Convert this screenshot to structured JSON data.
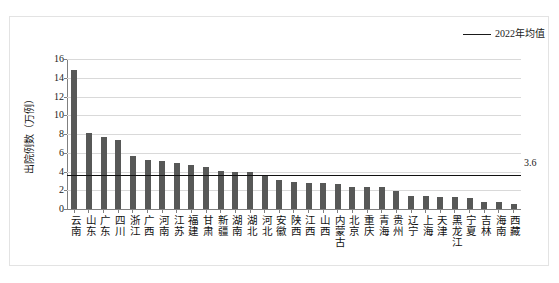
{
  "chart_data": {
    "type": "bar",
    "title": "",
    "xlabel": "",
    "ylabel": "出院例数（万例）",
    "ylim": [
      0,
      16
    ],
    "yticks": [
      0,
      2,
      4,
      6,
      8,
      10,
      12,
      14,
      16
    ],
    "grid": true,
    "legend_position": "top-right",
    "legend": [
      {
        "name": "2022年均值",
        "type": "line",
        "color": "#1a1a1a"
      }
    ],
    "bar_color": "#575857",
    "annotations": [
      {
        "text": "3.6",
        "value": 3.6,
        "position": "right-of-mean-line"
      }
    ],
    "reference_line": {
      "label": "2022年均值",
      "value": 3.6,
      "value_label": "3.6",
      "color": "#111111"
    },
    "categories": [
      "云南",
      "山东",
      "广东",
      "四川",
      "浙江",
      "广西",
      "河南",
      "江苏",
      "福建",
      "甘肃",
      "新疆",
      "湖南",
      "湖北",
      "河北",
      "安徽",
      "陕西",
      "江西",
      "山西",
      "内蒙古",
      "北京",
      "重庆",
      "青海",
      "贵州",
      "辽宁",
      "上海",
      "天津",
      "黑龙江",
      "宁夏",
      "吉林",
      "海南",
      "西藏"
    ],
    "values": [
      14.8,
      8.1,
      7.7,
      7.4,
      5.7,
      5.2,
      5.1,
      4.9,
      4.7,
      4.5,
      4.1,
      3.9,
      3.9,
      3.5,
      3.1,
      2.85,
      2.8,
      2.8,
      2.65,
      2.4,
      2.4,
      2.35,
      1.9,
      1.4,
      1.4,
      1.3,
      1.25,
      1.2,
      0.75,
      0.75,
      0.5
    ],
    "series": [
      {
        "name": "出院例数（万例）",
        "values": [
          14.8,
          8.1,
          7.7,
          7.4,
          5.7,
          5.2,
          5.1,
          4.9,
          4.7,
          4.5,
          4.1,
          3.9,
          3.9,
          3.5,
          3.1,
          2.85,
          2.8,
          2.8,
          2.65,
          2.4,
          2.4,
          2.35,
          1.9,
          1.4,
          1.4,
          1.3,
          1.25,
          1.2,
          0.75,
          0.75,
          0.5
        ]
      }
    ]
  }
}
